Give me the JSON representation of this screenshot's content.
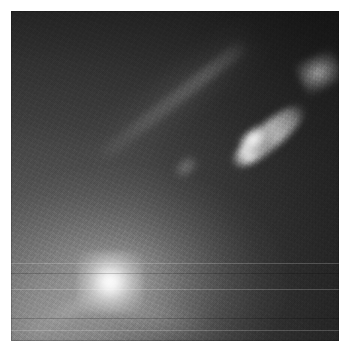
{
  "viewer": {
    "title": "Astronomical Image",
    "image_type": "grayscale-astronomical-photograph",
    "subject": "galaxy nucleus with relativistic jet",
    "canvas": {
      "width": 349,
      "height": 352
    },
    "frame": {
      "left": 11,
      "top": 11,
      "width": 328,
      "height": 330
    },
    "background_color": "#ffffff"
  },
  "palette": {
    "sky_dark": "#2a2a2a",
    "sky_mid": "#4a4a4a",
    "sky_light": "#8e8e8e",
    "nucleus_peak": "#f4f4f4",
    "jet_knot": "#c8c8c8",
    "outer_blob": "#9a9a9a"
  },
  "features": [
    {
      "name": "galaxy-nucleus",
      "label": "Nucleus",
      "shape": "point-source",
      "center": [
        99,
        282
      ],
      "peak_level": 244,
      "notes": "bright unresolved core with extended diffuse halo"
    },
    {
      "name": "galaxy-halo",
      "label": "Diffuse halo",
      "shape": "elliptical-diffuse",
      "center": [
        92,
        290
      ],
      "peak_level": 150,
      "notes": "smooth starlight envelope filling lower-left quadrant"
    },
    {
      "name": "jet-streak",
      "label": "Jet (inner)",
      "shape": "linear-filament",
      "start": [
        110,
        258
      ],
      "end": [
        232,
        144
      ],
      "peak_level": 96,
      "position_angle_deg": -38,
      "notes": "faint narrow linear feature extending from the nucleus"
    },
    {
      "name": "jet-knot-main",
      "label": "Jet knot",
      "shape": "elongated-knot",
      "start": [
        234,
        140
      ],
      "end": [
        298,
        92
      ],
      "peak_level": 212,
      "position_angle_deg": -40,
      "notes": "bright elongated knot, brightest at its south-west tip"
    },
    {
      "name": "jet-knot-outer",
      "label": "Outer knot",
      "shape": "compact-blob",
      "center": [
        309,
        61
      ],
      "peak_level": 152,
      "notes": "detached fainter condensation beyond the main knot"
    }
  ],
  "artifacts": {
    "scan_lines": [
      263,
      273,
      289,
      318,
      330
    ],
    "noise_gradient": "noise amplitude increases toward the right / upper edge",
    "notes": "detector readout striping visible as faint horizontal rows"
  }
}
